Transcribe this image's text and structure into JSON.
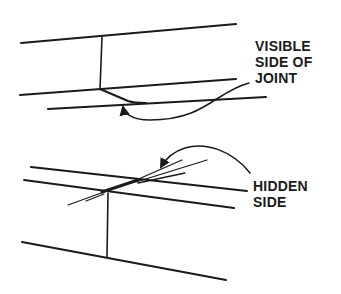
{
  "diagram": {
    "figures": [
      {
        "id": "top",
        "label_lines": [
          "VISIBLE",
          "SIDE OF",
          "JOINT"
        ]
      },
      {
        "id": "bottom",
        "label_lines": [
          "HIDDEN",
          "SIDE"
        ]
      }
    ],
    "colors": {
      "ink": "#1a1a1a",
      "background": "#ffffff"
    }
  }
}
